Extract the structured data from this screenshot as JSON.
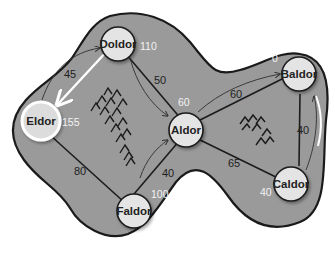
{
  "diagram": {
    "type": "weighted-graph-shortest-path",
    "colors": {
      "region_fill": "#9a9a9a",
      "region_stroke": "#1a1a1a",
      "node_fill": "#e4e4e4",
      "highlight": "#ffffff",
      "distance_text": "#f2f2f2"
    },
    "nodes": [
      {
        "id": "eldor",
        "label": "Eldor",
        "distance": "155",
        "highlighted": true
      },
      {
        "id": "doldor",
        "label": "Doldor",
        "distance": "110"
      },
      {
        "id": "aldor",
        "label": "Aldor",
        "distance": "60"
      },
      {
        "id": "faldor",
        "label": "Faldor",
        "distance": "100"
      },
      {
        "id": "baldor",
        "label": "Baldor",
        "distance": "0"
      },
      {
        "id": "caldor",
        "label": "Caldor",
        "distance": "40"
      }
    ],
    "edges": [
      {
        "from": "eldor",
        "to": "doldor",
        "weight": "45",
        "highlighted": true
      },
      {
        "from": "doldor",
        "to": "aldor",
        "weight": "50"
      },
      {
        "from": "eldor",
        "to": "faldor",
        "weight": "80"
      },
      {
        "from": "faldor",
        "to": "aldor",
        "weight": "40"
      },
      {
        "from": "aldor",
        "to": "baldor",
        "weight": "60"
      },
      {
        "from": "aldor",
        "to": "caldor",
        "weight": "65"
      },
      {
        "from": "baldor",
        "to": "caldor",
        "weight": "40"
      }
    ],
    "decorations": [
      "mountains-left",
      "mountains-right"
    ]
  }
}
